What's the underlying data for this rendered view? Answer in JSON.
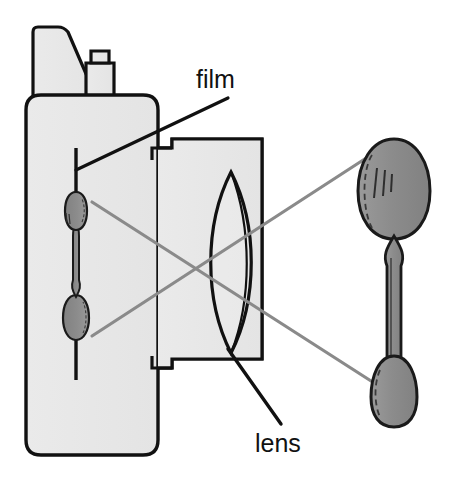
{
  "figure": {
    "type": "optical-ray-diagram",
    "background_color": "#ffffff"
  },
  "labels": {
    "film": "film",
    "lens": "lens"
  },
  "colors": {
    "outline": "#111111",
    "body_fill": "#e8e8e8",
    "barrel_fill": "#e4e4e4",
    "spoon_fill": "#8f8f8f",
    "spoon_outline": "#1a1a1a",
    "ray": "#8a8a8a",
    "leader": "#111111",
    "film_line": "#111111",
    "text": "#111111"
  },
  "parts": {
    "camera_body": "camera-body",
    "viewfinder_hump": "viewfinder-hump",
    "shutter_button": "shutter-button-block",
    "lens_barrel": "lens-barrel",
    "lens_element": "biconvex-lens",
    "film_plane": "film-plane-line",
    "inverted_image": "inverted-spoon-image",
    "object": "real-spoon-object"
  },
  "rays": [
    {
      "name": "ray-top-of-object-to-bottom-of-image",
      "from": "object-top",
      "to": "image-bottom"
    },
    {
      "name": "ray-bottom-of-object-to-top-of-image",
      "from": "object-bottom",
      "to": "image-top"
    }
  ],
  "geometry": {
    "film_line_x": 76,
    "film_line_y1": 148,
    "film_line_y2": 380,
    "lens_center_x": 231,
    "body_left": 26,
    "body_right": 158,
    "barrel_right": 262
  }
}
